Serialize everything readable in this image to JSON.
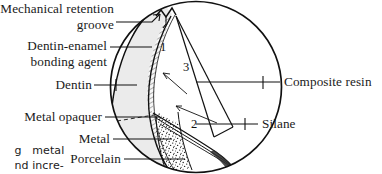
{
  "figure": {
    "shape": "circular-inset-magnification",
    "background_color": "#ffffff",
    "line_color": "#111111"
  },
  "labels_left": [
    {
      "name": "mechanical-retention-groove",
      "line1": "Mechanical retention",
      "line2": "groove",
      "pointer": "arrow"
    },
    {
      "name": "dentin-enamel-bonding-agent",
      "line1": "Dentin-enamel",
      "line2": "bonding agent",
      "pointer": "line"
    },
    {
      "name": "dentin",
      "line1": "Dentin",
      "pointer": "line"
    },
    {
      "name": "metal-opaquer",
      "line1": "Metal opaquer",
      "pointer": "line"
    },
    {
      "name": "metal",
      "line1": "Metal",
      "pointer": "line"
    },
    {
      "name": "porcelain",
      "line1": "Porcelain",
      "pointer": "line"
    }
  ],
  "labels_right": [
    {
      "name": "composite-resin",
      "text": "Composite resin",
      "pointer": "line"
    },
    {
      "name": "silane",
      "text": "Silane",
      "pointer": "line"
    }
  ],
  "numbered_callouts": [
    {
      "name": "callout-1",
      "text": "1"
    },
    {
      "name": "callout-2",
      "text": "2"
    },
    {
      "name": "callout-3",
      "text": "3"
    }
  ],
  "body_text_fragments": [
    {
      "name": "body-fragment-line-1",
      "text": "g   metal"
    },
    {
      "name": "body-fragment-line-2",
      "text": "nd incre-"
    }
  ],
  "regions": [
    {
      "name": "dentin-region",
      "fill": "#ebebeb"
    },
    {
      "name": "porcelain-region",
      "fill": "#ffffff",
      "texture": "stipple"
    },
    {
      "name": "composite-resin-region",
      "fill": "#ffffff"
    },
    {
      "name": "metal-region",
      "fill": "#ffffff"
    }
  ]
}
